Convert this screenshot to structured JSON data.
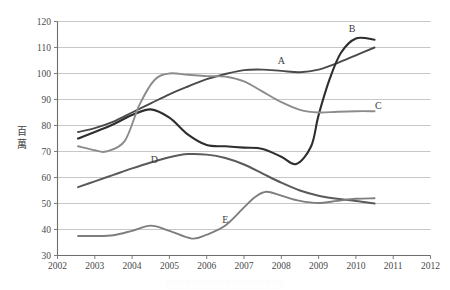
{
  "chart_data": {
    "type": "line",
    "title": "",
    "xlabel": "",
    "ylabel": "百萬",
    "ylabel_chars": [
      "百",
      "萬"
    ],
    "xlim": [
      2002,
      2012
    ],
    "ylim": [
      30,
      120
    ],
    "grid": true,
    "legend": "inline-labels",
    "x_ticks": [
      "2002",
      "2003",
      "2004",
      "2005",
      "2006",
      "2007",
      "2008",
      "2009",
      "2010",
      "2011",
      "2012"
    ],
    "y_ticks": [
      "30",
      "40",
      "50",
      "60",
      "70",
      "80",
      "90",
      "100",
      "110",
      "120"
    ],
    "series": [
      {
        "name": "A",
        "label": "A",
        "color": "#4a4a4a",
        "width": 1.9,
        "label_x": 2008.0,
        "label_y": 103.5,
        "x": [
          2002.55,
          2003.0,
          2003.5,
          2004.0,
          2004.5,
          2005.0,
          2005.5,
          2006.0,
          2006.5,
          2007.0,
          2007.5,
          2008.0,
          2008.5,
          2009.0,
          2009.5,
          2010.0,
          2010.5
        ],
        "y": [
          77.5,
          79.0,
          81.5,
          85.0,
          88.5,
          92.0,
          95.0,
          97.8,
          99.8,
          101.3,
          101.5,
          101.0,
          100.5,
          101.5,
          104.0,
          107.0,
          110.0
        ]
      },
      {
        "name": "B",
        "label": "B",
        "color": "#2e2e2e",
        "width": 2.1,
        "label_x": 2009.9,
        "label_y": 116.0,
        "x": [
          2002.55,
          2003.0,
          2003.5,
          2004.0,
          2004.5,
          2005.0,
          2005.5,
          2006.0,
          2006.5,
          2007.0,
          2007.5,
          2008.0,
          2008.4,
          2008.8,
          2009.0,
          2009.3,
          2009.6,
          2010.0,
          2010.5
        ],
        "y": [
          75.0,
          77.5,
          80.5,
          84.0,
          86.2,
          83.0,
          76.5,
          72.5,
          72.0,
          71.5,
          71.0,
          68.0,
          65.2,
          72.0,
          84.0,
          98.0,
          108.0,
          113.5,
          113.0
        ]
      },
      {
        "name": "C",
        "label": "C",
        "color": "#8c8c8c",
        "width": 1.9,
        "label_x": 2010.6,
        "label_y": 86.5,
        "x": [
          2002.55,
          2003.0,
          2003.3,
          2003.8,
          2004.2,
          2004.6,
          2005.0,
          2005.5,
          2006.0,
          2006.5,
          2007.0,
          2007.5,
          2008.0,
          2008.5,
          2009.0,
          2009.5,
          2010.0,
          2010.5
        ],
        "y": [
          72.0,
          70.5,
          70.0,
          74.0,
          88.0,
          97.5,
          100.0,
          99.5,
          99.0,
          98.8,
          97.0,
          93.0,
          89.0,
          86.0,
          85.0,
          85.3,
          85.5,
          85.5
        ]
      },
      {
        "name": "D",
        "label": "D",
        "color": "#5a5a5a",
        "width": 2.0,
        "label_x": 2004.6,
        "label_y": 65.5,
        "x": [
          2002.55,
          2003.0,
          2003.5,
          2004.0,
          2004.5,
          2005.0,
          2005.5,
          2006.0,
          2006.5,
          2007.0,
          2007.5,
          2008.0,
          2008.5,
          2009.0,
          2009.5,
          2010.0,
          2010.5
        ],
        "y": [
          56.3,
          58.5,
          61.0,
          63.5,
          65.8,
          67.8,
          69.0,
          68.8,
          67.5,
          65.0,
          61.5,
          58.0,
          55.0,
          53.0,
          51.8,
          51.0,
          50.0
        ]
      },
      {
        "name": "E",
        "label": "E",
        "color": "#7e7e7e",
        "width": 1.9,
        "label_x": 2006.5,
        "label_y": 42.5,
        "x": [
          2002.55,
          2003.0,
          2003.5,
          2004.0,
          2004.5,
          2005.0,
          2005.6,
          2006.0,
          2006.5,
          2007.0,
          2007.3,
          2007.6,
          2008.0,
          2008.5,
          2009.0,
          2009.5,
          2010.0,
          2010.5
        ],
        "y": [
          37.5,
          37.5,
          37.8,
          39.5,
          41.5,
          39.5,
          36.5,
          38.0,
          41.5,
          48.5,
          52.5,
          54.5,
          53.0,
          51.0,
          50.2,
          51.0,
          51.8,
          52.0
        ]
      }
    ]
  },
  "footnote": {
    "text": "░░░░░░░░░░░░░░░░░░"
  }
}
